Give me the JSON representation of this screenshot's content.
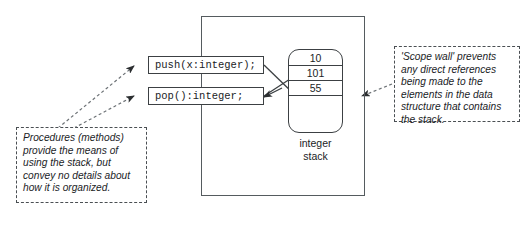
{
  "diagram": {
    "scope_wall": {
      "name": "scope-wall-boundary"
    },
    "methods": [
      {
        "id": "push",
        "signature": "push(x:integer);"
      },
      {
        "id": "pop",
        "signature": "pop():integer;"
      }
    ],
    "stack": {
      "label_line1": "integer",
      "label_line2": "stack",
      "cells": [
        "10",
        "101",
        "55"
      ]
    },
    "callouts": {
      "left": "Procedures (methods) provide the means of using the stack, but convey no details about how it is organized.",
      "right": "'Scope wall' prevents any direct references being made to the elements in the data structure that contains the stack."
    },
    "colors": {
      "line": "#3c4043",
      "wall": "#555b5f",
      "dashed": "#4a4f53",
      "background": "#ffffff",
      "text": "#1b1d1f"
    }
  }
}
